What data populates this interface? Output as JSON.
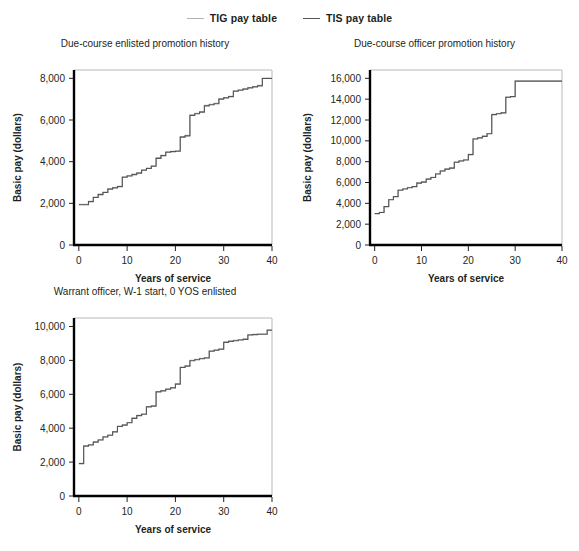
{
  "figure": {
    "title": "",
    "legend": {
      "position": "top-center",
      "entries": [
        {
          "label": "TIG pay table",
          "color": "#b3b3b3",
          "icon": "line-swatch-icon"
        },
        {
          "label": "TIS pay table",
          "color": "#555555",
          "icon": "line-swatch-icon"
        }
      ]
    }
  },
  "chart_data": [
    {
      "type": "line",
      "step": "post",
      "title": "Due-course enlisted promotion history",
      "xlabel": "Years of service",
      "ylabel": "Basic pay (dollars)",
      "xlim": [
        -1,
        40
      ],
      "ylim": [
        0,
        8400
      ],
      "xticks": [
        0,
        10,
        20,
        30,
        40
      ],
      "xticklabels": [
        "0",
        "10",
        "20",
        "30",
        "40"
      ],
      "yticks": [
        0,
        2000,
        4000,
        6000,
        8000
      ],
      "yticklabels": [
        "0",
        "2,000",
        "4,000",
        "6,000",
        "8,000"
      ],
      "grid": false,
      "series": [
        {
          "name": "TIG pay table",
          "color": "#b3b3b3",
          "x": [
            0,
            1,
            2,
            3,
            4,
            5,
            6,
            7,
            8,
            9,
            10,
            11,
            12,
            13,
            14,
            15,
            16,
            17,
            18,
            19,
            20,
            21,
            22,
            23,
            24,
            25,
            26,
            27,
            28,
            29,
            30,
            31,
            32,
            33,
            34,
            35,
            36,
            37,
            38,
            39
          ],
          "y": [
            1950,
            1950,
            2100,
            2300,
            2440,
            2540,
            2700,
            2760,
            2820,
            3270,
            3330,
            3400,
            3470,
            3610,
            3690,
            3800,
            4180,
            4310,
            4470,
            4500,
            4520,
            5200,
            5260,
            6240,
            6320,
            6400,
            6700,
            6750,
            6800,
            7020,
            7080,
            7140,
            7400,
            7450,
            7500,
            7560,
            7610,
            7660,
            8010,
            8010
          ]
        },
        {
          "name": "TIS pay table",
          "color": "#555555",
          "x": [
            0,
            1,
            2,
            3,
            4,
            5,
            6,
            7,
            8,
            9,
            10,
            11,
            12,
            13,
            14,
            15,
            16,
            17,
            18,
            19,
            20,
            21,
            22,
            23,
            24,
            25,
            26,
            27,
            28,
            29,
            30,
            31,
            32,
            33,
            34,
            35,
            36,
            37,
            38,
            39
          ],
          "y": [
            1930,
            1930,
            2080,
            2280,
            2420,
            2520,
            2680,
            2740,
            2800,
            3250,
            3310,
            3380,
            3450,
            3590,
            3670,
            3780,
            4160,
            4290,
            4450,
            4480,
            4500,
            5180,
            5240,
            6220,
            6300,
            6380,
            6680,
            6730,
            6780,
            7000,
            7060,
            7120,
            7380,
            7430,
            7480,
            7540,
            7590,
            7640,
            7990,
            7990
          ]
        }
      ]
    },
    {
      "type": "line",
      "step": "post",
      "title": "Due-course officer promotion history",
      "xlabel": "Years of service",
      "ylabel": "Basic pay (dollars)",
      "xlim": [
        -1,
        40
      ],
      "ylim": [
        0,
        16800
      ],
      "xticks": [
        0,
        10,
        20,
        30,
        40
      ],
      "xticklabels": [
        "0",
        "10",
        "20",
        "30",
        "40"
      ],
      "yticks": [
        0,
        2000,
        4000,
        6000,
        8000,
        10000,
        12000,
        14000,
        16000
      ],
      "yticklabels": [
        "0",
        "2,000",
        "4,000",
        "6,000",
        "8,000",
        "10,000",
        "12,000",
        "14,000",
        "16,000"
      ],
      "grid": false,
      "series": [
        {
          "name": "TIG pay table",
          "color": "#b3b3b3",
          "x": [
            0,
            1,
            2,
            3,
            4,
            5,
            6,
            7,
            8,
            9,
            10,
            11,
            12,
            13,
            14,
            15,
            16,
            17,
            18,
            19,
            20,
            21,
            22,
            23,
            24,
            25,
            26,
            27,
            28,
            29,
            30,
            31,
            32,
            33,
            34,
            35,
            36,
            37,
            38,
            39
          ],
          "y": [
            3030,
            3140,
            3700,
            4370,
            4660,
            5280,
            5400,
            5520,
            5620,
            5960,
            6060,
            6340,
            6500,
            6840,
            7120,
            7300,
            7400,
            7960,
            8080,
            8180,
            8700,
            10200,
            10300,
            10450,
            10700,
            12540,
            12620,
            12700,
            14200,
            14260,
            15750,
            15750,
            15750,
            15750,
            15750,
            15750,
            15750,
            15750,
            15750,
            15750
          ]
        },
        {
          "name": "TIS pay table",
          "color": "#555555",
          "x": [
            0,
            1,
            2,
            3,
            4,
            5,
            6,
            7,
            8,
            9,
            10,
            11,
            12,
            13,
            14,
            15,
            16,
            17,
            18,
            19,
            20,
            21,
            22,
            23,
            24,
            25,
            26,
            27,
            28,
            29,
            30,
            31,
            32,
            33,
            34,
            35,
            36,
            37,
            38,
            39
          ],
          "y": [
            3010,
            3120,
            3680,
            4350,
            4640,
            5260,
            5380,
            5500,
            5600,
            5940,
            6040,
            6320,
            6480,
            6820,
            7100,
            7280,
            7380,
            7940,
            8060,
            8160,
            8680,
            10180,
            10280,
            10430,
            10680,
            12520,
            12600,
            12680,
            14180,
            14240,
            15730,
            15730,
            15730,
            15730,
            15730,
            15730,
            15730,
            15730,
            15730,
            15730
          ]
        }
      ]
    },
    {
      "type": "line",
      "step": "post",
      "title": "Warrant officer, W-1 start, 0 YOS enlisted",
      "xlabel": "Years of service",
      "ylabel": "Basic pay (dollars)",
      "xlim": [
        -1,
        40
      ],
      "ylim": [
        0,
        10500
      ],
      "xticks": [
        0,
        10,
        20,
        30,
        40
      ],
      "xticklabels": [
        "0",
        "10",
        "20",
        "30",
        "40"
      ],
      "yticks": [
        0,
        2000,
        4000,
        6000,
        8000,
        10000
      ],
      "yticklabels": [
        "0",
        "2,000",
        "4,000",
        "6,000",
        "8,000",
        "10,000"
      ],
      "grid": false,
      "series": [
        {
          "name": "TIG pay table",
          "color": "#b3b3b3",
          "x": [
            0,
            1,
            2,
            3,
            4,
            5,
            6,
            7,
            8,
            9,
            10,
            11,
            12,
            13,
            14,
            15,
            16,
            17,
            18,
            19,
            20,
            21,
            22,
            23,
            24,
            25,
            26,
            27,
            28,
            29,
            30,
            31,
            32,
            33,
            34,
            35,
            36,
            37,
            38,
            39
          ],
          "y": [
            1930,
            2960,
            3030,
            3200,
            3320,
            3500,
            3600,
            3800,
            4120,
            4200,
            4340,
            4600,
            4760,
            4840,
            5280,
            5320,
            6160,
            6220,
            6320,
            6400,
            6620,
            7600,
            7680,
            8000,
            8060,
            8120,
            8160,
            8560,
            8620,
            8680,
            9080,
            9140,
            9180,
            9220,
            9260,
            9520,
            9540,
            9560,
            9560,
            9800
          ]
        },
        {
          "name": "TIS pay table",
          "color": "#555555",
          "x": [
            0,
            1,
            2,
            3,
            4,
            5,
            6,
            7,
            8,
            9,
            10,
            11,
            12,
            13,
            14,
            15,
            16,
            17,
            18,
            19,
            20,
            21,
            22,
            23,
            24,
            25,
            26,
            27,
            28,
            29,
            30,
            31,
            32,
            33,
            34,
            35,
            36,
            37,
            38,
            39
          ],
          "y": [
            1910,
            2940,
            3010,
            3180,
            3300,
            3480,
            3580,
            3780,
            4100,
            4180,
            4320,
            4580,
            4740,
            4820,
            5260,
            5300,
            6140,
            6200,
            6300,
            6380,
            6600,
            7580,
            7660,
            7980,
            8040,
            8100,
            8140,
            8540,
            8600,
            8660,
            9060,
            9120,
            9160,
            9200,
            9240,
            9500,
            9520,
            9540,
            9540,
            9780
          ]
        }
      ]
    }
  ],
  "panels": [
    {
      "key": "enlisted",
      "left": 0,
      "top": 38,
      "width": 290,
      "height": 248,
      "plot": {
        "x": 74,
        "y": 26,
        "w": 198,
        "h": 175
      }
    },
    {
      "key": "officer",
      "left": 290,
      "top": 38,
      "width": 289,
      "height": 248,
      "plot": {
        "x": 80,
        "y": 26,
        "w": 192,
        "h": 175
      }
    },
    {
      "key": "warrant",
      "left": 0,
      "top": 286,
      "width": 290,
      "height": 248,
      "plot": {
        "x": 74,
        "y": 26,
        "w": 198,
        "h": 178
      }
    }
  ]
}
